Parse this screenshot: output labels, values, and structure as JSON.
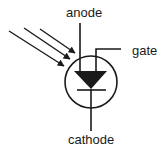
{
  "diagram": {
    "type": "circuit-symbol",
    "component": "light-activated SCR",
    "labels": {
      "anode": "anode",
      "gate": "gate",
      "cathode": "cathode"
    },
    "light_arrows": 3,
    "colors": {
      "stroke": "#1a1a1a",
      "background": "#ffffff"
    }
  }
}
